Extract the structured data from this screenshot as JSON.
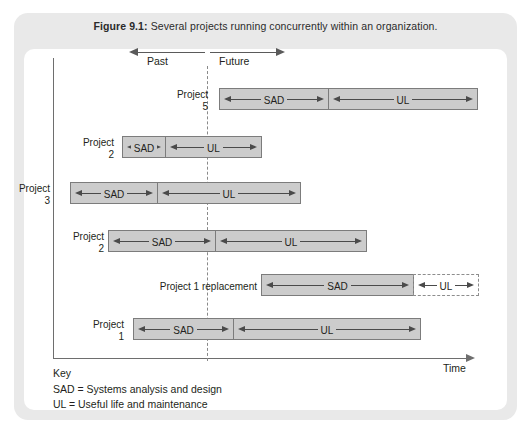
{
  "figure": {
    "caption_label": "Figure 9.1:",
    "caption_text": "Several projects running concurrently within an organization."
  },
  "axes": {
    "time_label": "Time",
    "past_label": "Past",
    "future_label": "Future",
    "now_line": "dashed-vertical-now-marker"
  },
  "key": {
    "title": "Key",
    "lines": [
      "SAD = Systems analysis and design",
      "UL = Useful life and maintenance"
    ]
  },
  "colors": {
    "bar_fill": "#cccccc",
    "bar_border": "#7c7c7c",
    "frame": "#e9e9e9",
    "axis": "#6e6e6e",
    "panel": "#ffffff"
  },
  "chart_data": {
    "type": "bar",
    "title": "Several projects running concurrently within an organization",
    "xlabel": "Time",
    "ylabel": "",
    "orientation": "horizontal-gantt",
    "now_marker_x": 207,
    "grid": false,
    "legend": [
      "SAD = Systems analysis and design",
      "UL = Useful life and maintenance"
    ],
    "categories": [
      "Project 5",
      "Project 2",
      "Project 3",
      "Project 2",
      "Project 1 replacement",
      "Project 1"
    ],
    "rows": [
      {
        "label": "Project\n5",
        "label_x": 160,
        "label_y": 89,
        "label_w": 48,
        "top": 88,
        "segments": [
          {
            "name": "SAD",
            "x": 219,
            "width": 110,
            "style": "solid"
          },
          {
            "name": "UL",
            "x": 328,
            "width": 150,
            "style": "solid"
          }
        ]
      },
      {
        "label": "Project\n2",
        "label_x": 66,
        "label_y": 137,
        "label_w": 48,
        "top": 136,
        "segments": [
          {
            "name": "SAD",
            "x": 122,
            "width": 44,
            "style": "solid"
          },
          {
            "name": "UL",
            "x": 165,
            "width": 97,
            "style": "solid"
          }
        ]
      },
      {
        "label": "Project\n3",
        "label_x": 2,
        "label_y": 183,
        "label_w": 48,
        "top": 182,
        "segments": [
          {
            "name": "SAD",
            "x": 70,
            "width": 88,
            "style": "solid"
          },
          {
            "name": "UL",
            "x": 157,
            "width": 144,
            "style": "solid"
          }
        ]
      },
      {
        "label": "Project\n2",
        "label_x": 56,
        "label_y": 231,
        "label_w": 48,
        "top": 230,
        "segments": [
          {
            "name": "SAD",
            "x": 108,
            "width": 108,
            "style": "solid"
          },
          {
            "name": "UL",
            "x": 215,
            "width": 152,
            "style": "solid"
          }
        ]
      },
      {
        "label": "Project 1 replacement",
        "label_x": 149,
        "label_y": 281,
        "label_w": 108,
        "top": 274,
        "segments": [
          {
            "name": "SAD",
            "x": 261,
            "width": 153,
            "style": "solid"
          },
          {
            "name": "UL",
            "x": 413,
            "width": 66,
            "style": "dashed"
          }
        ]
      },
      {
        "label": "Project\n1",
        "label_x": 76,
        "label_y": 319,
        "label_w": 48,
        "top": 318,
        "segments": [
          {
            "name": "SAD",
            "x": 133,
            "width": 101,
            "style": "solid"
          },
          {
            "name": "UL",
            "x": 233,
            "width": 188,
            "style": "solid"
          }
        ]
      }
    ]
  }
}
